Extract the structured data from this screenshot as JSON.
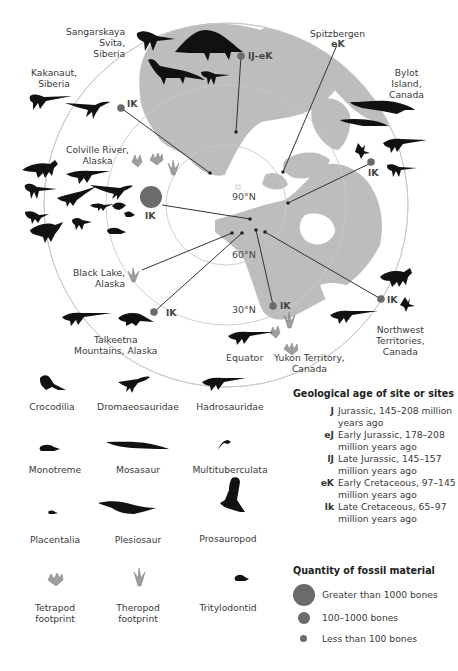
{
  "map": {
    "title_hidden": "Polar dinosaur fossil sites",
    "latitudes": [
      "90°N",
      "60°N",
      "30°N",
      "Equator"
    ],
    "sites": [
      {
        "name": "Sangarskaya Svita, Siberia",
        "lines": [
          "Sangarskaya",
          "Svita,",
          "Siberia"
        ],
        "age": "lJ-eK",
        "quantity": "less than 100"
      },
      {
        "name": "Spitzbergen",
        "lines": [
          "Spitzbergen"
        ],
        "age": "eK",
        "quantity": "less than 100"
      },
      {
        "name": "Kakanaut, Siberia",
        "lines": [
          "Kakanaut,",
          "Siberia"
        ],
        "age": "lK",
        "quantity": "less than 100"
      },
      {
        "name": "Bylot Island, Canada",
        "lines": [
          "Bylot",
          "Island,",
          "Canada"
        ],
        "age": "lK",
        "quantity": "less than 100"
      },
      {
        "name": "Colville River, Alaska",
        "lines": [
          "Colville River,",
          "Alaska"
        ],
        "age": "lK",
        "quantity": "greater than 1000"
      },
      {
        "name": "Black Lake, Alaska",
        "lines": [
          "Black Lake,",
          "Alaska"
        ],
        "age": "",
        "quantity": "footprint"
      },
      {
        "name": "Talkeetna Mountains, Alaska",
        "lines": [
          "Talkeetna",
          "Mountains, Alaska"
        ],
        "age": "lK",
        "quantity": "less than 100"
      },
      {
        "name": "Yukon Territory, Canada",
        "lines": [
          "Yukon Territory,",
          "Canada"
        ],
        "age": "lK",
        "quantity": "less than 100"
      },
      {
        "name": "Northwest Territories, Canada",
        "lines": [
          "Northwest",
          "Territories,",
          "Canada"
        ],
        "age": "lK",
        "quantity": "less than 100"
      }
    ]
  },
  "legend": {
    "taxa": [
      {
        "name": "Crocodilia",
        "icon": "crocodilia-icon"
      },
      {
        "name": "Dromaeosauridae",
        "icon": "dromaeosauridae-icon"
      },
      {
        "name": "Hadrosauridae",
        "icon": "hadrosauridae-icon"
      },
      {
        "name": "Monotreme",
        "icon": "monotreme-icon"
      },
      {
        "name": "Mosasaur",
        "icon": "mosasaur-icon"
      },
      {
        "name": "Multituberculata",
        "icon": "multituberculata-icon"
      },
      {
        "name": "Placentalia",
        "icon": "placentalia-icon"
      },
      {
        "name": "Plesiosaur",
        "icon": "plesiosaur-icon"
      },
      {
        "name": "Prosauropod",
        "icon": "prosauropod-icon"
      },
      {
        "name": "Tetrapod footprint",
        "lines": [
          "Tetrapod",
          "footprint"
        ],
        "icon": "tetrapod-footprint-icon"
      },
      {
        "name": "Theropod footprint",
        "lines": [
          "Theropod",
          "footprint"
        ],
        "icon": "theropod-footprint-icon"
      },
      {
        "name": "Tritylodontid",
        "icon": "tritylodontid-icon"
      }
    ],
    "age": {
      "heading": "Geological age of site or sites",
      "items": [
        {
          "code": "J",
          "lines": [
            "Jurassic, 145–208 million",
            "years ago"
          ]
        },
        {
          "code": "eJ",
          "lines": [
            "Early Jurassic, 178–208",
            "million years ago"
          ]
        },
        {
          "code": "lJ",
          "lines": [
            "Late Jurassic, 145–157",
            "million years ago"
          ]
        },
        {
          "code": "eK",
          "lines": [
            "Early Cretaceous, 97–145",
            "million years ago"
          ]
        },
        {
          "code": "lk",
          "lines": [
            "Late Cretaceous, 65–97",
            "million years ago"
          ]
        }
      ]
    },
    "quantity": {
      "heading": "Quantity of fossil material",
      "items": [
        {
          "label": "Greater than 1000 bones",
          "size": 22
        },
        {
          "label": "100–1000 bones",
          "size": 12
        },
        {
          "label": "Less than 100 bones",
          "size": 7
        }
      ]
    }
  },
  "colors": {
    "land": "#bdbdbd",
    "ocean": "#ffffff",
    "grid": "#c8c8c8",
    "marker": "#6b6b6b",
    "footprint": "#9e9e9e",
    "silhouette": "#111111"
  }
}
